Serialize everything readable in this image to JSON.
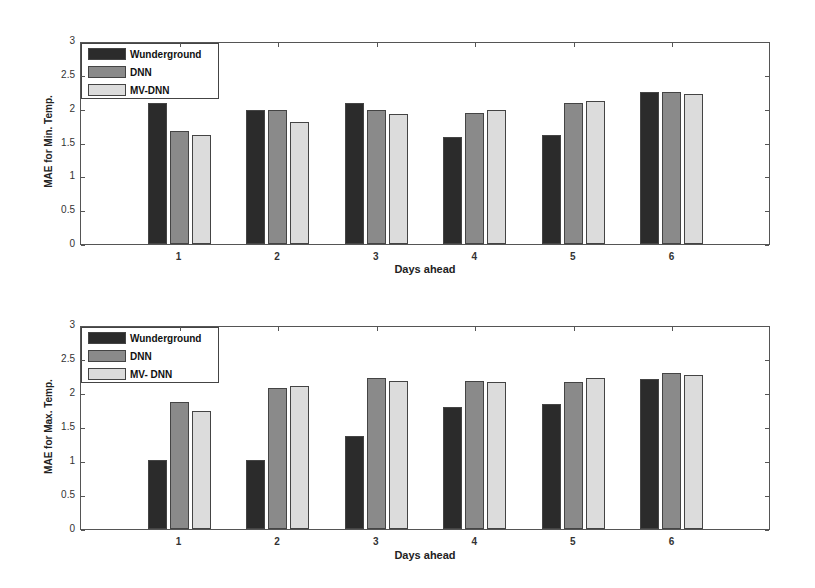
{
  "colors": {
    "Wunderground": "#2b2b2b",
    "DNN": "#8a8a8a",
    "MV-DNN": "#dcdcdc"
  },
  "legend": [
    "Wunderground",
    "DNN",
    "MV-DNN"
  ],
  "legend_bottom": [
    "Wunderground",
    "DNN",
    "MV- DNN"
  ],
  "yticks": [
    "0",
    "0.5",
    "1",
    "1.5",
    "2",
    "2.5",
    "3"
  ],
  "xticks": [
    "1",
    "2",
    "3",
    "4",
    "5",
    "6"
  ],
  "chart_data": [
    {
      "type": "bar",
      "title": "",
      "xlabel": "Days ahead",
      "ylabel": "MAE for Min. Temp.",
      "ylim": [
        0,
        3
      ],
      "xlim": [
        0,
        7
      ],
      "grid": false,
      "legend_position": "upper-left",
      "categories": [
        "1",
        "2",
        "3",
        "4",
        "5",
        "6"
      ],
      "series": [
        {
          "name": "Wunderground",
          "values": [
            2.09,
            1.98,
            2.08,
            1.58,
            1.61,
            2.24
          ]
        },
        {
          "name": "DNN",
          "values": [
            1.67,
            1.98,
            1.98,
            1.93,
            2.08,
            2.24
          ]
        },
        {
          "name": "MV-DNN",
          "values": [
            1.61,
            1.81,
            1.92,
            1.98,
            2.11,
            2.22
          ]
        }
      ]
    },
    {
      "type": "bar",
      "title": "",
      "xlabel": "Days ahead",
      "ylabel": "MAE for Max. Temp.",
      "ylim": [
        0,
        3
      ],
      "xlim": [
        0,
        7
      ],
      "grid": false,
      "legend_position": "upper-left",
      "categories": [
        "1",
        "2",
        "3",
        "4",
        "5",
        "6"
      ],
      "series": [
        {
          "name": "Wunderground",
          "values": [
            1.02,
            1.01,
            1.37,
            1.79,
            1.84,
            2.21
          ]
        },
        {
          "name": "DNN",
          "values": [
            1.87,
            2.08,
            2.22,
            2.18,
            2.16,
            2.29
          ]
        },
        {
          "name": "MV- DNN",
          "values": [
            1.73,
            2.11,
            2.18,
            2.16,
            2.22,
            2.27
          ]
        }
      ]
    }
  ]
}
